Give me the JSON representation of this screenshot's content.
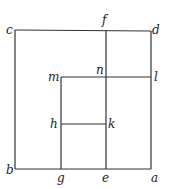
{
  "diagram": {
    "line_color": "#333333",
    "points": {
      "c": {
        "label": "c",
        "x": 15,
        "y": 30
      },
      "d": {
        "label": "d",
        "x": 151,
        "y": 31
      },
      "f": {
        "label": "f",
        "x": 106,
        "y": 30
      },
      "m": {
        "label": "m",
        "x": 61,
        "y": 77
      },
      "n": {
        "label": "n",
        "x": 106,
        "y": 77
      },
      "l": {
        "label": "l",
        "x": 151,
        "y": 77
      },
      "h": {
        "label": "h",
        "x": 61,
        "y": 124
      },
      "k": {
        "label": "k",
        "x": 106,
        "y": 124
      },
      "b": {
        "label": "b",
        "x": 15,
        "y": 169
      },
      "g": {
        "label": "g",
        "x": 61,
        "y": 169
      },
      "e": {
        "label": "e",
        "x": 106,
        "y": 169
      },
      "a": {
        "label": "a",
        "x": 151,
        "y": 169
      }
    },
    "segments": [
      [
        "c",
        "d"
      ],
      [
        "d",
        "a"
      ],
      [
        "a",
        "b"
      ],
      [
        "b",
        "c"
      ],
      [
        "f",
        "e"
      ],
      [
        "m",
        "l"
      ],
      [
        "m",
        "g"
      ],
      [
        "h",
        "k"
      ]
    ]
  }
}
